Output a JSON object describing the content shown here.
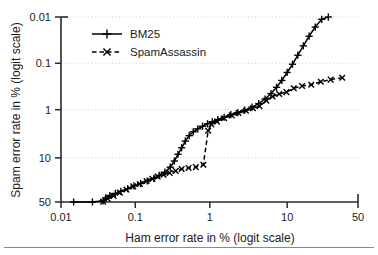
{
  "chart_data": {
    "type": "line",
    "title": "",
    "subtitle": "",
    "xlabel": "Ham error rate in % (logit scale)",
    "ylabel": "Spam error rate in % (logit scale)",
    "x_scale": "logit",
    "y_scale": "logit",
    "y_inverted": true,
    "grid": true,
    "grid_style": "dotted-horizontal",
    "legend_position": "top-left-inside",
    "xticks": [
      0.01,
      0.1,
      1,
      10,
      50
    ],
    "xtick_labels": [
      "0.01",
      "0.1",
      "1",
      "10",
      "50"
    ],
    "yticks": [
      0.01,
      0.1,
      1,
      10,
      50
    ],
    "ytick_labels": [
      "0.01",
      "0.1",
      "1",
      "10",
      "50"
    ],
    "xlim": [
      0.01,
      50
    ],
    "ylim": [
      0.01,
      50
    ],
    "series": [
      {
        "name": "BM25",
        "marker": "plus",
        "linestyle": "solid",
        "color": "#000000",
        "points": [
          [
            0.0148,
            50.0
          ],
          [
            0.0265,
            50.0
          ],
          [
            0.037,
            48.5
          ],
          [
            0.04,
            45.0
          ],
          [
            0.0455,
            42.0
          ],
          [
            0.054,
            39.5
          ],
          [
            0.064,
            37.0
          ],
          [
            0.079,
            34.0
          ],
          [
            0.096,
            31.0
          ],
          [
            0.118,
            28.5
          ],
          [
            0.145,
            26.0
          ],
          [
            0.178,
            23.5
          ],
          [
            0.21,
            21.0
          ],
          [
            0.25,
            18.5
          ],
          [
            0.295,
            15.0
          ],
          [
            0.335,
            11.5
          ],
          [
            0.375,
            8.5
          ],
          [
            0.42,
            6.3
          ],
          [
            0.47,
            4.6
          ],
          [
            0.53,
            3.55
          ],
          [
            0.6,
            2.95
          ],
          [
            0.69,
            2.55
          ],
          [
            0.8,
            2.25
          ],
          [
            0.93,
            2.0
          ],
          [
            1.08,
            1.8
          ],
          [
            1.28,
            1.62
          ],
          [
            1.55,
            1.45
          ],
          [
            1.9,
            1.28
          ],
          [
            2.35,
            1.15
          ],
          [
            2.9,
            1.02
          ],
          [
            3.6,
            0.88
          ],
          [
            4.4,
            0.74
          ],
          [
            5.3,
            0.59
          ],
          [
            6.3,
            0.45
          ],
          [
            7.4,
            0.33
          ],
          [
            8.6,
            0.235
          ],
          [
            10.0,
            0.158
          ],
          [
            11.6,
            0.105
          ],
          [
            13.4,
            0.067
          ],
          [
            15.5,
            0.042
          ],
          [
            18.0,
            0.026
          ],
          [
            21.0,
            0.0165
          ],
          [
            24.5,
            0.0112
          ],
          [
            28.5,
            0.01
          ]
        ]
      },
      {
        "name": "SpamAssassin",
        "marker": "x",
        "linestyle": "dashed",
        "color": "#000000",
        "points": [
          [
            0.037,
            49.5
          ],
          [
            0.0425,
            46.0
          ],
          [
            0.051,
            42.5
          ],
          [
            0.062,
            38.5
          ],
          [
            0.076,
            35.0
          ],
          [
            0.094,
            31.5
          ],
          [
            0.115,
            29.0
          ],
          [
            0.142,
            26.0
          ],
          [
            0.17,
            24.0
          ],
          [
            0.2,
            22.0
          ],
          [
            0.24,
            20.5
          ],
          [
            0.29,
            19.0
          ],
          [
            0.35,
            17.5
          ],
          [
            0.42,
            16.2
          ],
          [
            0.52,
            15.5
          ],
          [
            0.65,
            15.0
          ],
          [
            0.82,
            13.5
          ],
          [
            0.95,
            2.8
          ],
          [
            1.05,
            2.05
          ],
          [
            1.25,
            1.8
          ],
          [
            1.55,
            1.52
          ],
          [
            1.95,
            1.32
          ],
          [
            2.4,
            1.18
          ],
          [
            3.0,
            1.05
          ],
          [
            3.7,
            0.93
          ],
          [
            4.5,
            0.84
          ],
          [
            5.5,
            0.64
          ],
          [
            6.6,
            0.52
          ],
          [
            8.0,
            0.46
          ],
          [
            9.8,
            0.42
          ],
          [
            12.0,
            0.345
          ],
          [
            15.0,
            0.31
          ],
          [
            19.0,
            0.29
          ],
          [
            24.0,
            0.25
          ],
          [
            30.0,
            0.225
          ],
          [
            38.0,
            0.205
          ]
        ]
      }
    ],
    "legend": [
      {
        "label": "BM25",
        "marker": "plus",
        "linestyle": "solid"
      },
      {
        "label": "SpamAssassin",
        "marker": "x",
        "linestyle": "dashed"
      }
    ]
  }
}
